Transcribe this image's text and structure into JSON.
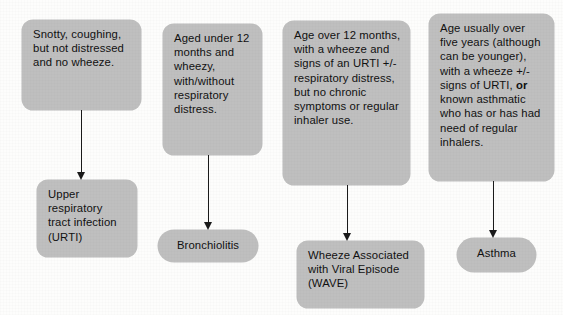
{
  "diagram": {
    "type": "flowchart",
    "colors": {
      "node_fill": "#bfbfbf",
      "text": "#111111",
      "arrow": "#1a1a1a",
      "background": "#fdfdfc"
    },
    "columns": [
      {
        "id": "urti",
        "criteria": {
          "text": "Snotty, coughing, but not distressed and no wheeze."
        },
        "arrow": {
          "direction": "down"
        },
        "outcome": {
          "text": "Upper respiratory tract infection (URTI)",
          "shape": "rounded-rect"
        }
      },
      {
        "id": "bronchiolitis",
        "criteria": {
          "text": "Aged under 12 months and wheezy, with/without respiratory distress."
        },
        "arrow": {
          "direction": "down"
        },
        "outcome": {
          "text": "Bronchiolitis",
          "shape": "pill"
        }
      },
      {
        "id": "wave",
        "criteria": {
          "text": "Age over 12 months, with a wheeze and signs of an URTI +/- respiratory distress, but no chronic symptoms or regular inhaler use."
        },
        "arrow": {
          "direction": "down"
        },
        "outcome": {
          "text": "Wheeze Associated with Viral Episode (WAVE)",
          "shape": "rounded-rect"
        }
      },
      {
        "id": "asthma",
        "criteria": {
          "text_before_bold": "Age usually over five years (although can be younger), with a wheeze +/- signs of URTI, ",
          "bold_word": "or",
          "text_after_bold": " known asthmatic who has or has had need of regular inhalers."
        },
        "arrow": {
          "direction": "down"
        },
        "outcome": {
          "text": "Asthma",
          "shape": "pill"
        }
      }
    ]
  }
}
